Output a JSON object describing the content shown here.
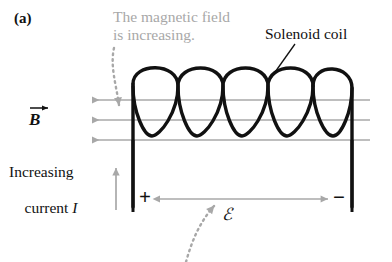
{
  "figure": {
    "panel_label": "(a)",
    "background_color": "#ffffff",
    "ink_color": "#111111",
    "annotation_color": "#a8a8a8",
    "width": 392,
    "height": 262
  },
  "annotations": {
    "magnetic_field_note_line1": "The magnetic field",
    "magnetic_field_note_line2": "is increasing.",
    "solenoid_label": "Solenoid coil",
    "current_note_line1": "Increasing",
    "current_note_line2": "current I",
    "current_note_symbol": "I"
  },
  "symbols": {
    "b_field": "B",
    "b_field_vector_arrow": "→",
    "emf": "ℰ",
    "positive_terminal": "+",
    "negative_terminal": "−"
  },
  "icons": {
    "field_line_arrow": "left-arrow-icon",
    "current_arrow": "up-arrow-icon",
    "emf_arrow": "double-headed-arrow-icon",
    "pointer_magnetic": "dotted-pointer-arrow-icon",
    "pointer_emf": "dotted-pointer-arrow-icon",
    "leader_solenoid": "leader-line-icon"
  },
  "diagram": {
    "field_lines_count": 3,
    "field_direction": "left",
    "coil_turns": 5,
    "emf_direction": "plus-to-minus"
  }
}
